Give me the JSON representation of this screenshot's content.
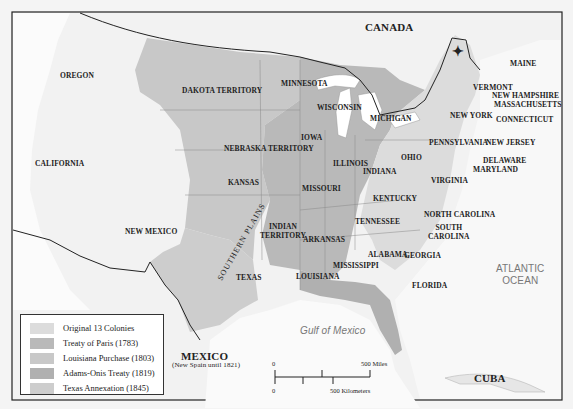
{
  "map": {
    "title_labels": {
      "canada": "CANADA",
      "mexico": "MEXICO",
      "mexico_note": "(New Spain until 1821)",
      "cuba": "CUBA",
      "gulf": "Gulf of Mexico",
      "atlantic_line1": "ATLANTIC",
      "atlantic_line2": "OCEAN",
      "southern_plains": "SOUTHERN PLAINS"
    },
    "compass": {
      "n": "N",
      "s": "S",
      "e": "E",
      "w": "W"
    },
    "regions": [
      {
        "name": "OREGON"
      },
      {
        "name": "CALIFORNIA"
      },
      {
        "name": "NEW MEXICO"
      },
      {
        "name": "DAKOTA TERRITORY"
      },
      {
        "name": "NEBRASKA TERRITORY"
      },
      {
        "name": "KANSAS"
      },
      {
        "name": "INDIAN TERRITORY"
      },
      {
        "name": "TEXAS"
      },
      {
        "name": "MINNESOTA"
      },
      {
        "name": "IOWA"
      },
      {
        "name": "MISSOURI"
      },
      {
        "name": "ARKANSAS"
      },
      {
        "name": "LOUISIANA"
      },
      {
        "name": "WISCONSIN"
      },
      {
        "name": "ILLINOIS"
      },
      {
        "name": "MICHIGAN"
      },
      {
        "name": "INDIANA"
      },
      {
        "name": "OHIO"
      },
      {
        "name": "KENTUCKY"
      },
      {
        "name": "TENNESSEE"
      },
      {
        "name": "MISSISSIPPI"
      },
      {
        "name": "ALABAMA"
      },
      {
        "name": "GEORGIA"
      },
      {
        "name": "FLORIDA"
      },
      {
        "name": "SOUTH CAROLINA"
      },
      {
        "name": "NORTH CAROLINA"
      },
      {
        "name": "VIRGINIA"
      },
      {
        "name": "PENNSYLVANIA"
      },
      {
        "name": "NEW YORK"
      },
      {
        "name": "NEW JERSEY"
      },
      {
        "name": "DELAWARE"
      },
      {
        "name": "MARYLAND"
      },
      {
        "name": "CONNECTICUT"
      },
      {
        "name": "MASSACHUSETTS"
      },
      {
        "name": "NEW HAMPSHIRE"
      },
      {
        "name": "VERMONT"
      },
      {
        "name": "MAINE"
      }
    ]
  },
  "legend": {
    "items": [
      {
        "label": "Original 13 Colonies",
        "color": "#dcdcdc"
      },
      {
        "label": "Treaty of Paris (1783)",
        "color": "#b9b9b9"
      },
      {
        "label": "Louisiana Purchase (1803)",
        "color": "#c8c8c8"
      },
      {
        "label": "Adams-Onis Treaty (1819)",
        "color": "#b0b0b0"
      },
      {
        "label": "Texas Annexation (1845)",
        "color": "#cdcdcd"
      }
    ]
  },
  "scale": {
    "zero_miles": "0",
    "miles_label": "500 Miles",
    "zero_km": "0",
    "km_label": "500 Kilometers"
  },
  "colors": {
    "land_other": "#f1f1f1",
    "water": "#ffffff",
    "border": "#222222",
    "state_line": "#888888"
  }
}
